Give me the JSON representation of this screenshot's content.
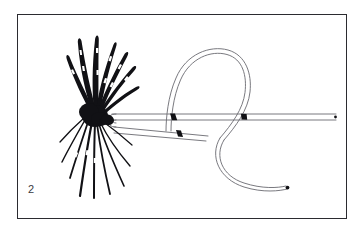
{
  "figure": {
    "number_label": "2",
    "caption": "",
    "style": "black-and-white line art engraving"
  },
  "colors": {
    "background": "#ffffff",
    "frame_border": "#2b2b30",
    "ink_dark": "#111115",
    "ink_line": "#6a6a70",
    "ink_line_light": "#9a9aa0",
    "label_text": "#3a3a3f"
  },
  "frame": {
    "x": 17,
    "y": 14,
    "width": 330,
    "height": 205,
    "border_width": 1
  },
  "elements": {
    "fly": {
      "name": "dry-fly-with-hackle",
      "head_center_x": 96,
      "head_center_y": 116,
      "fiber_count_upper": 7,
      "fiber_count_lower": 9,
      "description": "dense black hackle fibers splayed up-right and down-right from a dark head"
    },
    "leader_line": {
      "name": "monofilament-leader",
      "render": "double parallel stroke",
      "standing_end_label": "standing line to the right",
      "standing_end_y": 117,
      "standing_end_right_x": 336,
      "tag_end_tip_x": 287,
      "tag_end_tip_y": 187
    },
    "loop": {
      "name": "open-overhand-loop",
      "center_x": 208,
      "center_y": 86,
      "radius_x": 40,
      "radius_y": 39,
      "top_y": 48
    },
    "crossings": [
      {
        "name": "upper-crossing",
        "x": 173,
        "y": 117
      },
      {
        "name": "lower-crossing",
        "x": 179,
        "y": 133
      },
      {
        "name": "right-crossing",
        "x": 244,
        "y": 117
      }
    ],
    "turnaround": {
      "name": "line-turnaround-at-eye",
      "x": 113,
      "y": 125
    }
  }
}
